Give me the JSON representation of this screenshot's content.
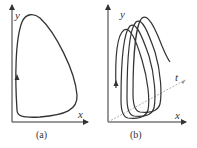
{
  "panels": [
    {
      "caption": "(a)",
      "x_label": "x",
      "y_label": "y",
      "description": "closed limit cycle in x-y phase plane"
    },
    {
      "caption": "(b)",
      "x_label": "x",
      "y_label": "y",
      "t_label": "t",
      "description": "trajectory spiraling along t axis forming repeated loops"
    }
  ],
  "colors": {
    "stroke": "#333333",
    "dashed": "#999999"
  }
}
